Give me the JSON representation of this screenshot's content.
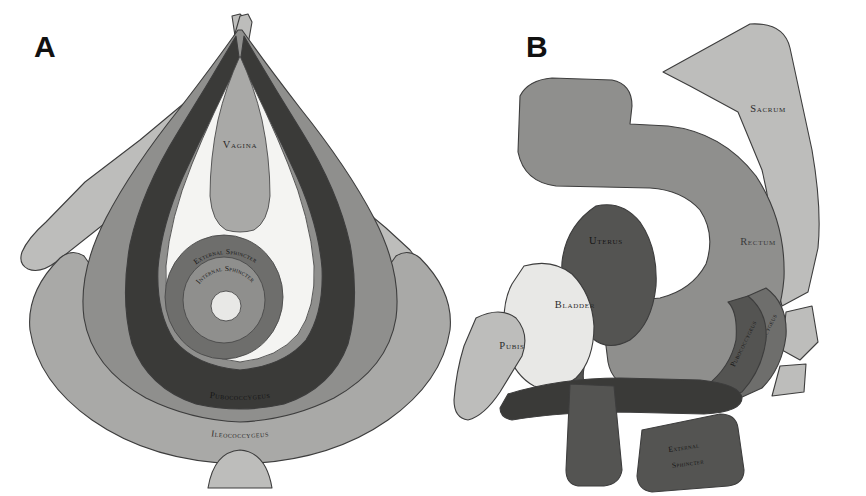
{
  "figure": {
    "background_color": "#ffffff",
    "outline_color": "#3d3d3d",
    "panels": [
      {
        "id": "A",
        "letter": "A",
        "caption_view": "Perineal (inferior) view of the female pelvic floor"
      },
      {
        "id": "B",
        "letter": "B",
        "caption_view": "Mid-sagittal view of the female pelvis"
      }
    ]
  },
  "palette": {
    "white": "#ffffff",
    "pale_gray": "#e8e8e6",
    "light_gray": "#bdbdbb",
    "mid_light_gray": "#a9a9a7",
    "mid_gray": "#8f8f8d",
    "dark_gray": "#6e6e6c",
    "darker_gray": "#545452",
    "very_dark": "#3a3a38",
    "near_black": "#2e2e2c",
    "text_dark": "#2b2b2b"
  },
  "panel_a": {
    "letter": "A",
    "labels": {
      "vagina": "Vagina",
      "external_sphincter": "External Sphincter",
      "internal_sphincter": "Internal Sphincter",
      "pubococcygeus": "Pubococcygeus",
      "ileococcygeus": "Ileococcygeus"
    },
    "structures": [
      {
        "name": "ischiopubic-ramus-left",
        "label": "",
        "fill": "#bdbdbb"
      },
      {
        "name": "ischiopubic-ramus-right",
        "label": "",
        "fill": "#bdbdbb"
      },
      {
        "name": "ileococcygeus-sheet",
        "label": "Ileococcygeus",
        "fill": "#a9a9a7"
      },
      {
        "name": "pubococcygeus-sheet",
        "label": "Pubococcygeus",
        "fill": "#8f8f8d"
      },
      {
        "name": "puborectalis-sling",
        "label": "",
        "fill": "#3a3a38"
      },
      {
        "name": "vagina-wedge",
        "label": "Vagina",
        "fill": "#a9a9a7"
      },
      {
        "name": "levator-hiatus",
        "label": "",
        "fill": "#f4f4f2"
      },
      {
        "name": "external-sphincter-ring",
        "label": "External Sphincter",
        "fill": "#6e6e6c"
      },
      {
        "name": "internal-sphincter-ring",
        "label": "Internal Sphincter",
        "fill": "#8f8f8d"
      },
      {
        "name": "anal-canal-lumen",
        "label": "",
        "fill": "#e8e8e6"
      },
      {
        "name": "coccyx",
        "label": "",
        "fill": "#bdbdbb"
      }
    ]
  },
  "panel_b": {
    "letter": "B",
    "labels": {
      "sacrum": "Sacrum",
      "rectum": "Rectum",
      "uterus": "Uterus",
      "bladder": "Bladder",
      "pubis": "Pubis",
      "ileococcygeus": "Ileococcygeus",
      "pubococcygeus": "Pubococcygeus",
      "external_sphincter_line1": "External",
      "external_sphincter_line2": "Sphincter"
    },
    "structures": [
      {
        "name": "sacrum",
        "label": "Sacrum",
        "fill": "#bdbdbb"
      },
      {
        "name": "coccyx-segment",
        "label": "",
        "fill": "#bdbdbb"
      },
      {
        "name": "rectum",
        "label": "Rectum",
        "fill": "#8f8f8d"
      },
      {
        "name": "uterus",
        "label": "Uterus",
        "fill": "#545452"
      },
      {
        "name": "bladder",
        "label": "Bladder",
        "fill": "#e8e8e6"
      },
      {
        "name": "pubis",
        "label": "Pubis",
        "fill": "#bdbdbb"
      },
      {
        "name": "ileococcygeus-band",
        "label": "Ileococcygeus",
        "fill": "#6e6e6c"
      },
      {
        "name": "pubococcygeus-band",
        "label": "Pubococcygeus",
        "fill": "#545452"
      },
      {
        "name": "levator-plate",
        "label": "",
        "fill": "#3a3a38"
      },
      {
        "name": "vaginal-canal",
        "label": "",
        "fill": "#545452"
      },
      {
        "name": "external-sphincter-block",
        "label": "External Sphincter",
        "fill": "#545452"
      }
    ]
  }
}
